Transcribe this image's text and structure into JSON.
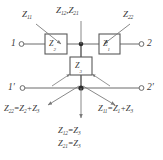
{
  "diagram": {
    "colors": {
      "wire": "#6b6b6b",
      "box_stroke": "#5a5a5a",
      "box_fill": "#ffffff",
      "node": "#2b2b2b",
      "text": "#3a3a3a",
      "arrow": "#7a7a7a",
      "background": "#ffffff"
    },
    "annotations": {
      "top_left": "Z11",
      "top_center": "Z12, Z21",
      "top_right": "Z22"
    },
    "annotation_parts": {
      "top_left": {
        "base": "Z",
        "sub": "11"
      },
      "top_center_a": {
        "base": "Z",
        "sub": "12"
      },
      "top_center_b": {
        "base": "Z",
        "sub": "21"
      },
      "top_right": {
        "base": "Z",
        "sub": "22"
      }
    },
    "elements": [
      {
        "name": "series-left",
        "label": "Z2",
        "base": "Z",
        "sub": "2"
      },
      {
        "name": "series-right",
        "label": "Z1",
        "base": "Z",
        "sub": "1"
      },
      {
        "name": "shunt-center",
        "label": "Z3",
        "base": "Z",
        "sub": "3"
      }
    ],
    "terminals": [
      {
        "name": "terminal-1",
        "label": "1"
      },
      {
        "name": "terminal-2",
        "label": "2"
      },
      {
        "name": "terminal-1-prime",
        "label": "1′"
      },
      {
        "name": "terminal-2-prime",
        "label": "2′"
      }
    ],
    "equations": {
      "bottom_left": {
        "lhs": "Z",
        "lhs_sub": "22",
        "eq": "=",
        "t1": "Z",
        "t1_sub": "2",
        "plus": "+",
        "t2": "Z",
        "t2_sub": "3"
      },
      "bottom_right": {
        "lhs": "Z",
        "lhs_sub": "11",
        "eq": "=",
        "t1": "Z",
        "t1_sub": "1",
        "plus": "+",
        "t2": "Z",
        "t2_sub": "3"
      },
      "bottom_center_1": {
        "lhs": "Z",
        "lhs_sub": "12",
        "eq": "=",
        "rhs": "Z",
        "rhs_sub": "3"
      },
      "bottom_center_2": {
        "lhs": "Z",
        "lhs_sub": "21",
        "eq": "=",
        "rhs": "Z",
        "rhs_sub": "3"
      }
    }
  }
}
